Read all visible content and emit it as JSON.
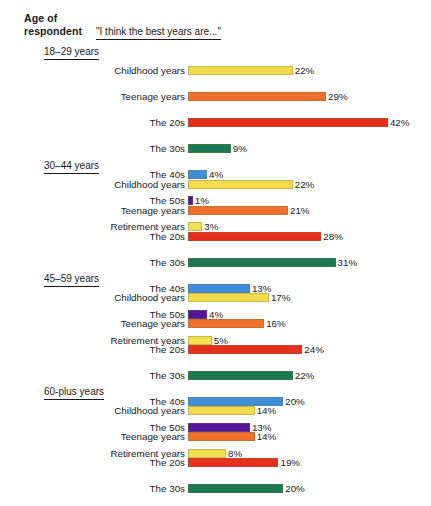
{
  "header": {
    "age_line1": "Age of",
    "age_line2": "respondent",
    "question": "\"I think the best years are...\""
  },
  "palette": {
    "childhood": "#F2DC4E",
    "teenage": "#EF6F2C",
    "twenties": "#E8301F",
    "thirties": "#1B7A55",
    "forties": "#3E8FD8",
    "fifties": "#54179A",
    "retirement": "#F5E054"
  },
  "chart_data": {
    "type": "bar",
    "title": "\"I think the best years are...\"",
    "xlabel": "",
    "ylabel": "",
    "xlim": [
      0,
      42
    ],
    "grid": false,
    "legend": "none",
    "orientation": "horizontal",
    "value_suffix": "%",
    "categories": [
      "Childhood years",
      "Teenage years",
      "The 20s",
      "The 30s",
      "The 40s",
      "The 50s",
      "Retirement years"
    ],
    "groups": [
      {
        "name": "18–29 years",
        "values": [
          22,
          29,
          42,
          9,
          4,
          1,
          3
        ],
        "labels": [
          "22%",
          "29%",
          "42%",
          "9%",
          "4%",
          "1%",
          "3%"
        ]
      },
      {
        "name": "30–44 years",
        "values": [
          22,
          21,
          28,
          31,
          13,
          4,
          5
        ],
        "labels": [
          "22%",
          "21%",
          "28%",
          "31%",
          "13%",
          "4%",
          "5%"
        ]
      },
      {
        "name": "45–59 years",
        "values": [
          17,
          16,
          24,
          22,
          20,
          13,
          8
        ],
        "labels": [
          "17%",
          "16%",
          "24%",
          "22%",
          "20%",
          "13%",
          "8%"
        ]
      },
      {
        "name": "60-plus years",
        "values": [
          14,
          14,
          19,
          20,
          16,
          11,
          31
        ],
        "labels": [
          "14%",
          "14%",
          "19%",
          "20%",
          "16%",
          "11%",
          "31%"
        ]
      }
    ]
  }
}
